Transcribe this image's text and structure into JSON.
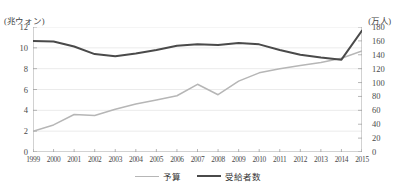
{
  "axes": {
    "left_unit": "(兆ウォン)",
    "right_unit": "(万人)"
  },
  "legend": {
    "budget_label": "予算",
    "recipients_label": "受給者数"
  },
  "colors": {
    "budget_line": "#b6b6b6",
    "recipients_line": "#4a4a4a",
    "gridline": "#e3e3e3",
    "axis": "#9a9a9a",
    "text": "#3f3f3f"
  },
  "chart_data": {
    "type": "line",
    "title": "",
    "xlabel": "",
    "grid": true,
    "legend_position": "bottom-center",
    "categories": [
      "1999",
      "2000",
      "2001",
      "2002",
      "2003",
      "2004",
      "2005",
      "2006",
      "2007",
      "2008",
      "2009",
      "2010",
      "2011",
      "2012",
      "2013",
      "2014",
      "2015"
    ],
    "axes": {
      "left": {
        "label": "(兆ウォン)",
        "ticks": [
          0,
          2,
          4,
          6,
          8,
          10,
          12
        ],
        "ylim": [
          0,
          12
        ]
      },
      "right": {
        "label": "(万人)",
        "ticks": [
          0,
          20,
          40,
          60,
          80,
          100,
          120,
          140,
          160,
          180
        ],
        "ylim": [
          0,
          180
        ]
      }
    },
    "series": [
      {
        "name": "予算",
        "axis": "left",
        "unit": "兆ウォン",
        "color": "#b6b6b6",
        "values": [
          2.0,
          2.6,
          3.6,
          3.5,
          4.1,
          4.6,
          5.0,
          5.4,
          6.5,
          5.5,
          6.8,
          7.6,
          8.0,
          8.3,
          8.6,
          9.0,
          9.7
        ]
      },
      {
        "name": "受給者数",
        "axis": "right",
        "unit": "万人",
        "color": "#4a4a4a",
        "values": [
          160,
          159,
          152,
          141,
          138,
          142,
          147,
          153,
          155,
          154,
          157,
          155,
          147,
          140,
          136,
          133,
          175
        ]
      }
    ]
  }
}
